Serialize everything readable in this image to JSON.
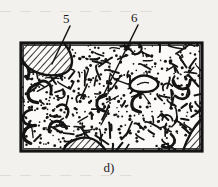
{
  "figure": {
    "caption": "d)",
    "frame": {
      "x": 20,
      "y": 42,
      "width": 183,
      "height": 110
    },
    "background_color": "#f3f1ee",
    "ink_color": "#141414",
    "matrix_fill_color": "#fbfaf8"
  },
  "callouts": [
    {
      "id": "callout-5",
      "label": "5",
      "label_x": 63,
      "label_y": 12,
      "leader_from": [
        70,
        26
      ],
      "leader_to": [
        52,
        64
      ],
      "points_to": "hatched-lens-top-left"
    },
    {
      "id": "callout-6",
      "label": "6",
      "label_x": 131,
      "label_y": 11,
      "leader_from": [
        138,
        25
      ],
      "leader_to": [
        103,
        96
      ],
      "points_to": "stippled-matrix"
    }
  ],
  "legend_semantics": {
    "5": "hatched rock-fragment lens (diagonal line hatching)",
    "6": "stippled gravelly-sand matrix (dot and dash texture)"
  },
  "inclusions": [
    {
      "name": "hatched-lens-top-left",
      "position": "top-left corner",
      "style": "diagonal-hatch"
    },
    {
      "name": "hatched-lens-bottom-mid",
      "position": "bottom edge, centre-left",
      "style": "diagonal-hatch"
    },
    {
      "name": "hatched-wedge-bottom-right",
      "position": "bottom-right corner",
      "style": "diagonal-hatch"
    },
    {
      "name": "clast-outline-oval",
      "position": "upper right of centre",
      "style": "closed outline"
    }
  ],
  "bleed_through": {
    "top_text": "—  —  —   —  —  —   —  —",
    "bottom_text": "—  —   —  —   —  —   —"
  }
}
